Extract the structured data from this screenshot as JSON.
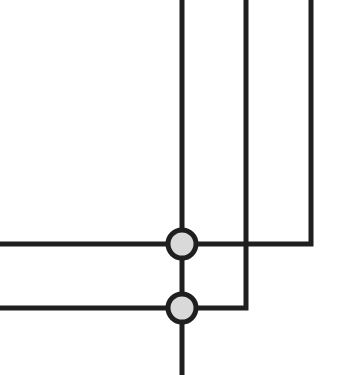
{
  "diagram": {
    "type": "wire-junction-diagram",
    "width": 344,
    "height": 375,
    "colors": {
      "background": "#ffffff",
      "wire": "#1f1f1f",
      "node_fill": "#d9d9d9",
      "node_stroke": "#1f1f1f"
    },
    "wire_width": 5,
    "wires": [
      {
        "id": "wire-main-vertical",
        "points": "182,0 182,375"
      },
      {
        "id": "wire-mid-vertical-to-lower-left",
        "points": "246,0 246,308 0,308"
      },
      {
        "id": "wire-right-vertical-to-upper-left",
        "points": "311,0 311,244 0,244"
      }
    ],
    "nodes": [
      {
        "id": "junction-upper",
        "cx": 182,
        "cy": 244,
        "r": 14
      },
      {
        "id": "junction-lower",
        "cx": 182,
        "cy": 308,
        "r": 14
      }
    ]
  }
}
